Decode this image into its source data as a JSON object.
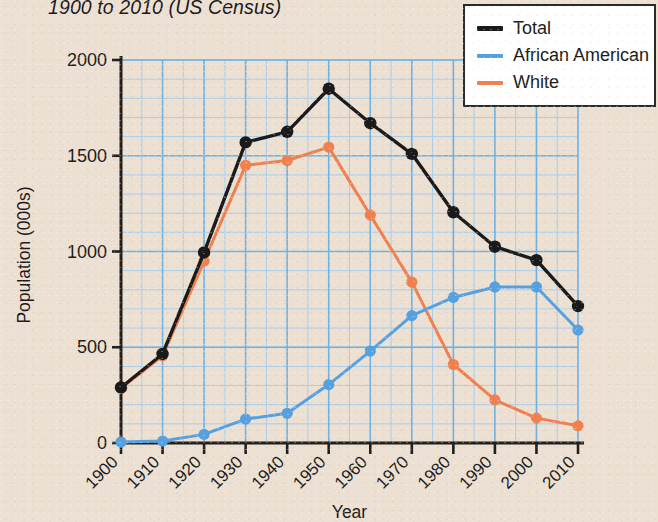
{
  "chart_title": "1900 to 2010 (US Census)",
  "background_color": "#ece0d3",
  "legend": {
    "position": "top-right",
    "items": [
      {
        "label": "Total",
        "color": "#1a1a1a"
      },
      {
        "label": "African American",
        "color": "#55a0e0"
      },
      {
        "label": "White",
        "color": "#f0804f"
      }
    ]
  },
  "axes": {
    "x_title": "Year",
    "y_title": "Population (000s)",
    "y_ticks": [
      "0",
      "500",
      "1000",
      "1500",
      "2000"
    ],
    "x_ticks": [
      "1900",
      "1910",
      "1920",
      "1930",
      "1940",
      "1950",
      "1960",
      "1970",
      "1980",
      "1990",
      "2000",
      "2010"
    ]
  },
  "chart_data": {
    "type": "line",
    "title": "1900 to 2010 (US Census)",
    "xlabel": "Year",
    "ylabel": "Population (000s)",
    "xlim": [
      1900,
      2010
    ],
    "ylim": [
      0,
      2000
    ],
    "grid": true,
    "grid_major_step": 500,
    "grid_minor_step": 100,
    "legend_position": "top-right",
    "categories": [
      1900,
      1910,
      1920,
      1930,
      1940,
      1950,
      1960,
      1970,
      1980,
      1990,
      2000,
      2010
    ],
    "series": [
      {
        "name": "Total",
        "color": "#1a1a1a",
        "values": [
          290,
          465,
          995,
          1570,
          1625,
          1850,
          1670,
          1510,
          1205,
          1025,
          955,
          715
        ]
      },
      {
        "name": "African American",
        "color": "#55a0e0",
        "values": [
          5,
          10,
          45,
          125,
          155,
          305,
          480,
          665,
          760,
          815,
          815,
          590
        ]
      },
      {
        "name": "White",
        "color": "#f0804f",
        "values": [
          285,
          455,
          950,
          1450,
          1475,
          1545,
          1190,
          840,
          410,
          225,
          130,
          90
        ]
      }
    ]
  }
}
